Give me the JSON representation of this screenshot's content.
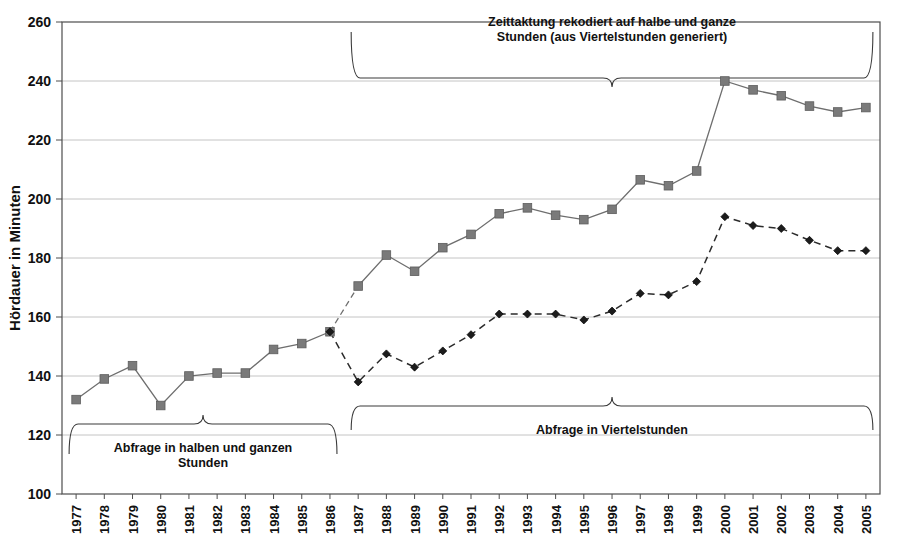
{
  "chart_data": {
    "type": "line",
    "title": "",
    "xlabel": "",
    "ylabel": "Hördauer in Minuten",
    "ylim": [
      100,
      260
    ],
    "ytick_step": 20,
    "yticks": [
      100,
      120,
      140,
      160,
      180,
      200,
      220,
      240,
      260
    ],
    "grid": true,
    "legend_position": "none",
    "categories": [
      "1977",
      "1978",
      "1979",
      "1980",
      "1981",
      "1982",
      "1983",
      "1984",
      "1985",
      "1986",
      "1987",
      "1988",
      "1989",
      "1990",
      "1991",
      "1992",
      "1993",
      "1994",
      "1995",
      "1996",
      "1997",
      "1998",
      "1999",
      "2000",
      "2001",
      "2002",
      "2003",
      "2004",
      "2005"
    ],
    "series": [
      {
        "name": "Zeittaktung rekodiert auf halbe und ganze Stunden",
        "marker": "square",
        "color": "#7a7a7a",
        "linestyle": "solid",
        "segment_dashed_between": [
          "1986",
          "1987"
        ],
        "values": [
          132,
          139,
          143.5,
          130,
          140,
          141,
          141,
          149,
          151,
          155,
          170.5,
          181,
          175.5,
          183.5,
          188,
          195,
          197,
          194.5,
          193,
          196.5,
          206.5,
          204.5,
          209.5,
          240,
          237,
          235,
          231.5,
          229.5,
          231
        ]
      },
      {
        "name": "Abfrage in Viertelstunden",
        "marker": "diamond",
        "color": "#1c1c1c",
        "linestyle": "dashed",
        "values": [
          null,
          null,
          null,
          null,
          null,
          null,
          null,
          null,
          null,
          155,
          138,
          147.5,
          143,
          148.5,
          154,
          161,
          161,
          161,
          159,
          162,
          168,
          167.5,
          172,
          194,
          191,
          190,
          186,
          182.5,
          182.5
        ]
      }
    ],
    "annotations": [
      {
        "id": "top-brace",
        "text": "Zeittaktung rekodiert auf halbe und ganze\nStunden (aus Viertelstunden generiert)",
        "line1": "Zeittaktung rekodiert auf halbe und ganze",
        "line2": "Stunden (aus Viertelstunden generiert)",
        "span_from": "1987",
        "span_to": "2005",
        "position": "above"
      },
      {
        "id": "left-brace",
        "text": "Abfrage in halben und ganzen\nStunden",
        "line1": "Abfrage in halben und ganzen",
        "line2": "Stunden",
        "span_from": "1977",
        "span_to": "1986",
        "position": "below"
      },
      {
        "id": "right-brace",
        "text": "Abfrage in Viertelstunden",
        "line1": "Abfrage in Viertelstunden",
        "line2": "",
        "span_from": "1987",
        "span_to": "2005",
        "position": "below"
      }
    ]
  }
}
